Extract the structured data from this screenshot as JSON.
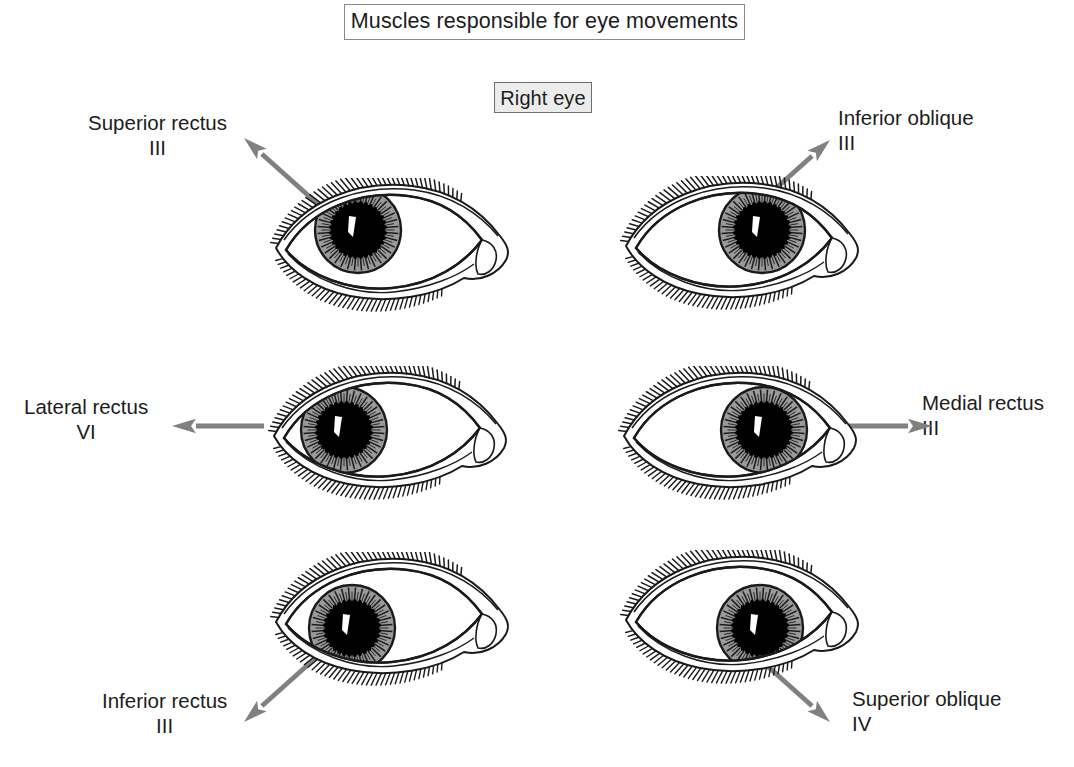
{
  "page": {
    "title": "Muscles responsible for eye movements",
    "eye_side": "Right eye",
    "background_color": "#ffffff",
    "arrow_color": "#808080",
    "iris_color": "#9a9a9a",
    "pupil_color": "#000000",
    "outline_color": "#1a1a1a"
  },
  "panels": [
    {
      "id": "superior-rectus",
      "muscle": "Superior rectus",
      "cranial_nerve": "III",
      "arrow_direction": "up-left",
      "gaze": "up",
      "iris_offset": {
        "x": -26,
        "y": -12
      },
      "label_position": "top-left"
    },
    {
      "id": "inferior-oblique",
      "muscle": "Inferior oblique",
      "cranial_nerve": "III",
      "arrow_direction": "up-right",
      "gaze": "up-and-in",
      "iris_offset": {
        "x": 28,
        "y": -10
      },
      "label_position": "top-right"
    },
    {
      "id": "lateral-rectus",
      "muscle": "Lateral rectus",
      "cranial_nerve": "VI",
      "arrow_direction": "left",
      "gaze": "out",
      "iris_offset": {
        "x": -38,
        "y": 0
      },
      "label_position": "middle-left"
    },
    {
      "id": "medial-rectus",
      "muscle": "Medial rectus",
      "cranial_nerve": "III",
      "arrow_direction": "right",
      "gaze": "in",
      "iris_offset": {
        "x": 32,
        "y": 0
      },
      "label_position": "middle-right"
    },
    {
      "id": "inferior-rectus",
      "muscle": "Inferior rectus",
      "cranial_nerve": "III",
      "arrow_direction": "down-left",
      "gaze": "down",
      "iris_offset": {
        "x": -32,
        "y": 12
      },
      "label_position": "bottom-left"
    },
    {
      "id": "superior-oblique",
      "muscle": "Superior oblique",
      "cranial_nerve": "IV",
      "arrow_direction": "down-right",
      "gaze": "down-and-in",
      "iris_offset": {
        "x": 26,
        "y": 14
      },
      "label_position": "bottom-right"
    }
  ]
}
